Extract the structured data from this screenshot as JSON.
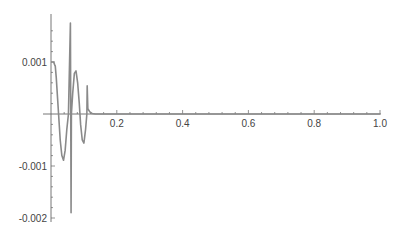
{
  "chart_data": {
    "type": "line",
    "title": "",
    "xlabel": "",
    "ylabel": "",
    "xlim": [
      0,
      1.0
    ],
    "ylim": [
      -0.002,
      0.0018
    ],
    "grid": false,
    "legend": null,
    "line_color": "#8a8a8a",
    "axis_color": "#666666",
    "x_ticks": [
      {
        "value": 0.2,
        "label": "0.2"
      },
      {
        "value": 0.4,
        "label": "0.4"
      },
      {
        "value": 0.6,
        "label": "0.6"
      },
      {
        "value": 0.8,
        "label": "0.8"
      },
      {
        "value": 1.0,
        "label": "1.0"
      }
    ],
    "y_ticks": [
      {
        "value": 0.001,
        "label": "0.001"
      },
      {
        "value": -0.001,
        "label": "-0.001"
      },
      {
        "value": -0.002,
        "label": "-0.002"
      }
    ],
    "series": [
      {
        "name": "signal",
        "points": [
          [
            0.0,
            0.001
          ],
          [
            0.008,
            0.001
          ],
          [
            0.011,
            0.00095
          ],
          [
            0.013,
            0.00092
          ],
          [
            0.016,
            0.0007
          ],
          [
            0.02,
            0.0003
          ],
          [
            0.023,
            0.0
          ],
          [
            0.028,
            -0.0005
          ],
          [
            0.033,
            -0.0008
          ],
          [
            0.038,
            -0.00089
          ],
          [
            0.043,
            -0.0007
          ],
          [
            0.048,
            -0.0003
          ],
          [
            0.053,
            0.0
          ],
          [
            0.059,
            0.00175
          ],
          [
            0.06,
            0.0
          ],
          [
            0.061,
            -0.0019
          ],
          [
            0.062,
            0.0
          ],
          [
            0.066,
            0.0004
          ],
          [
            0.071,
            0.00078
          ],
          [
            0.076,
            0.00083
          ],
          [
            0.081,
            0.0006
          ],
          [
            0.086,
            0.0002
          ],
          [
            0.09,
            -0.0002
          ],
          [
            0.095,
            -0.0005
          ],
          [
            0.1,
            -0.00056
          ],
          [
            0.105,
            -0.0003
          ],
          [
            0.109,
            0.0
          ],
          [
            0.11,
            0.00054
          ],
          [
            0.112,
            0.0001
          ],
          [
            0.118,
            4e-05
          ],
          [
            0.125,
            1e-05
          ],
          [
            0.135,
            0.0
          ],
          [
            0.2,
            0.0
          ],
          [
            0.4,
            0.0
          ],
          [
            0.6,
            0.0
          ],
          [
            0.8,
            0.0
          ],
          [
            1.0,
            0.0
          ]
        ]
      }
    ]
  }
}
